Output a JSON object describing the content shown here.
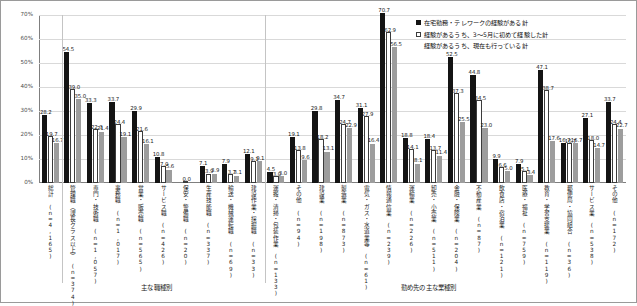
{
  "chart_data": {
    "type": "bar",
    "title": "",
    "xlabel": "",
    "ylabel": "",
    "ylim": [
      0,
      70
    ],
    "grid": true,
    "legend_position": "top-right",
    "ytick_labels": [
      "0%",
      "10%",
      "20%",
      "30%",
      "40%",
      "50%",
      "60%",
      "70%"
    ],
    "ytick_values": [
      0,
      10,
      20,
      30,
      40,
      50,
      60,
      70
    ],
    "legend": [
      "在宅勤務・テレワークの経験がある計",
      "経験があるうち、3～5月に初めて経験した計",
      "経験があるうち、現在も行っている計"
    ],
    "sections": [
      {
        "caption": "主な職種別",
        "start": 1,
        "count": 9
      },
      {
        "caption": "勤め先の主な業種別",
        "start": 10,
        "count": 14
      }
    ],
    "categories": [
      "総計",
      "管理職（課長クラス以上）",
      "専門・技術職",
      "事務職",
      "営業・販売職",
      "サービス職",
      "保安・警備職",
      "生産技能職",
      "輸送・機械運転職",
      "建設作業・採掘職",
      "運搬・清掃・包装作業",
      "その他",
      "建設業",
      "製造業",
      "電気・ガス・水道業等",
      "情報通信業",
      "運輸業",
      "卸売・小売業",
      "金融・保険業",
      "不動産業",
      "飲食店・宿泊業",
      "医療・福祉",
      "教育・学習支援業",
      "郵便局・協同組合",
      "サービス業",
      "その他"
    ],
    "category_n": [
      "(n=4,165)",
      "(n=374)",
      "(n=1,057)",
      "(n=1,017)",
      "(n=565)",
      "(n=426)",
      "(n=20)",
      "(n=337)",
      "(n=69)",
      "(n=33)",
      "(n=133)",
      "(n=94)",
      "(n=198)",
      "(n=873)",
      "(n=61)",
      "(n=239)",
      "(n=226)",
      "(n=511)",
      "(n=204)",
      "(n=87)",
      "(n=121)",
      "(n=759)",
      "(n=119)",
      "(n=36)",
      "(n=538)",
      "(n=172)"
    ],
    "series": [
      {
        "name": "在宅勤務・テレワークの経験がある計",
        "color": "#141414",
        "values": [
          28.2,
          54.5,
          33.3,
          33.7,
          29.9,
          10.8,
          0.0,
          7.1,
          7.9,
          12.1,
          4.5,
          19.1,
          29.8,
          34.7,
          31.1,
          70.7,
          18.8,
          18.4,
          52.5,
          44.8,
          9.9,
          7.9,
          47.1,
          16.7,
          27.1,
          33.7
        ]
      },
      {
        "name": "経験があるうち、3～5月に初めて経験した計",
        "color": "#ffffff",
        "values": [
          19.7,
          39.0,
          22.3,
          24.4,
          21.6,
          7.0,
          0.0,
          3.9,
          3.7,
          9.1,
          3.0,
          13.8,
          18.2,
          24.7,
          27.9,
          62.9,
          14.1,
          13.7,
          37.3,
          34.5,
          6.6,
          5.1,
          38.7,
          16.7,
          18.0,
          24.4
        ]
      },
      {
        "name": "経験があるうち、現在も行っている計",
        "color": "#9d9d9d",
        "values": [
          16.7,
          35.0,
          21.4,
          19.1,
          16.1,
          5.6,
          0.0,
          3.9,
          3.1,
          9.1,
          3.0,
          9.6,
          13.1,
          22.9,
          16.4,
          56.5,
          8.1,
          11.4,
          25.5,
          23.0,
          5.0,
          3.4,
          17.6,
          16.7,
          14.7,
          22.7
        ]
      }
    ],
    "zero_marker_label": "0.0"
  }
}
